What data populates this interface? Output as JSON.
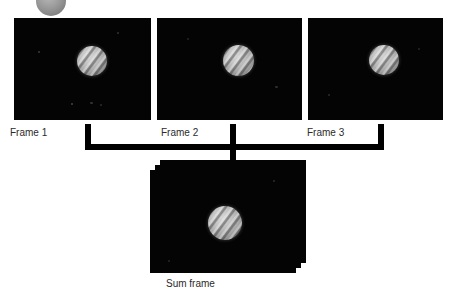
{
  "diagram": {
    "frames": [
      {
        "id": "frame-1",
        "label": "Frame 1"
      },
      {
        "id": "frame-2",
        "label": "Frame 2"
      },
      {
        "id": "frame-3",
        "label": "Frame 3"
      }
    ],
    "result": {
      "id": "sum-frame",
      "label": "Sum frame",
      "stack_layers": 3
    },
    "connector": {
      "type": "bracket",
      "inputs": 3,
      "outputs": 1
    },
    "colors": {
      "frame_background": "#040404",
      "page_background": "#ffffff",
      "connector": "#000000",
      "label_text": "#2b2b2b",
      "planet_highlight": "#d6d6d6",
      "bullet_gray": "#9a9a9a"
    }
  }
}
